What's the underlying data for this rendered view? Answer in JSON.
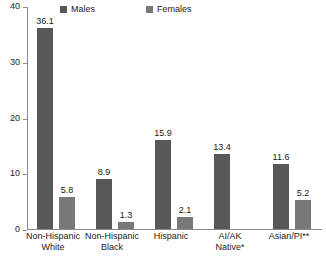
{
  "chart_data": {
    "type": "bar",
    "title": "",
    "xlabel": "",
    "ylabel": "",
    "ylim": [
      0,
      40
    ],
    "yticks": [
      "0",
      "10",
      "20",
      "30",
      "40"
    ],
    "grid": false,
    "legend_position": "top",
    "categories": [
      "Non-Hispanic White",
      "Non-Hispanic Black",
      "Hispanic",
      "AI/AK Native*",
      "Asian/PI**"
    ],
    "category_lines": [
      [
        "Non-Hispanic",
        "White"
      ],
      [
        "Non-Hispanic",
        "Black"
      ],
      [
        "Hispanic",
        ""
      ],
      [
        "AI/AK",
        "Native*"
      ],
      [
        "Asian/PI**",
        ""
      ]
    ],
    "series": [
      {
        "name": "Males",
        "color": "#585858",
        "values": [
          36.1,
          8.9,
          15.9,
          13.4,
          11.6
        ],
        "labels": [
          "36.1",
          "8.9",
          "15.9",
          "13.4",
          "11.6"
        ]
      },
      {
        "name": "Females",
        "color": "#787878",
        "values": [
          5.8,
          1.3,
          2.1,
          null,
          5.2
        ],
        "labels": [
          "5.8",
          "1.3",
          "2.1",
          "",
          "5.2"
        ]
      }
    ]
  },
  "legend": {
    "males_label": "Males",
    "females_label": "Females"
  },
  "colors": {
    "males": "#585858",
    "females": "#787878",
    "axis": "#8c8c8c",
    "text": "#1a1a1a",
    "background": "#ffffff"
  }
}
